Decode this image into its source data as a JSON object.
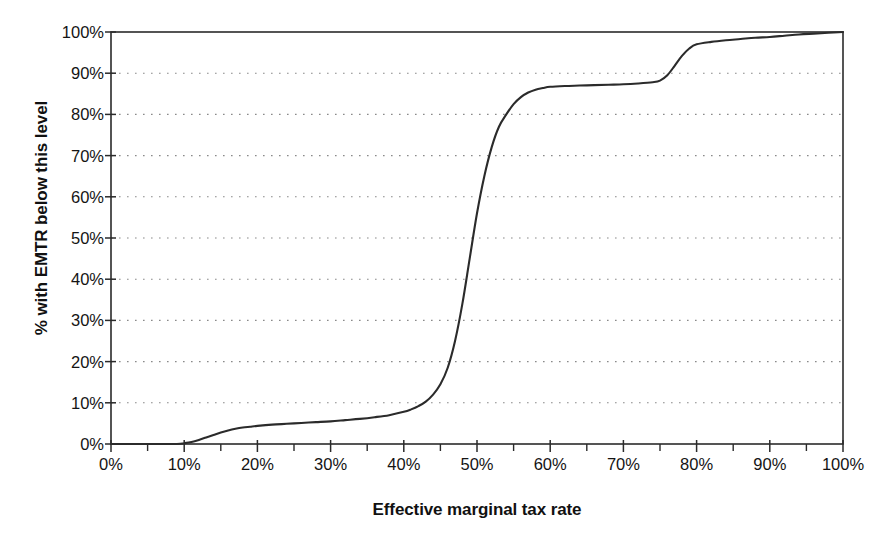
{
  "chart_data": {
    "type": "line",
    "title": "",
    "xlabel": "Effective marginal tax rate",
    "ylabel": "% with EMTR below this level",
    "xlim": [
      0,
      100
    ],
    "ylim": [
      0,
      100
    ],
    "grid": "horizontal-dotted",
    "legend": "none",
    "xticks": [
      "0%",
      "10%",
      "20%",
      "30%",
      "40%",
      "50%",
      "60%",
      "70%",
      "80%",
      "90%",
      "100%"
    ],
    "xtick_values": [
      0,
      10,
      20,
      30,
      40,
      50,
      60,
      70,
      80,
      90,
      100
    ],
    "yticks": [
      "0%",
      "10%",
      "20%",
      "30%",
      "40%",
      "50%",
      "60%",
      "70%",
      "80%",
      "90%",
      "100%"
    ],
    "ytick_values": [
      0,
      10,
      20,
      30,
      40,
      50,
      60,
      70,
      80,
      90,
      100
    ],
    "series": [
      {
        "name": "Cumulative distribution of EMTR",
        "color": "#2b2b2b",
        "x": [
          0,
          5,
          9,
          10,
          11,
          12,
          13,
          14,
          15,
          16,
          17,
          18,
          19,
          20,
          22,
          24,
          26,
          28,
          30,
          32,
          34,
          36,
          38,
          40,
          41,
          42,
          43,
          44,
          45,
          46,
          47,
          48,
          49,
          50,
          51,
          52,
          53,
          54,
          55,
          56,
          57,
          58,
          59,
          60,
          62,
          64,
          66,
          68,
          70,
          72,
          74,
          75,
          76,
          77,
          78,
          79,
          80,
          82,
          84,
          86,
          88,
          90,
          92,
          94,
          96,
          98,
          100
        ],
        "y": [
          0,
          0,
          0,
          0.2,
          0.5,
          1.0,
          1.6,
          2.2,
          2.8,
          3.3,
          3.7,
          4.0,
          4.2,
          4.4,
          4.7,
          4.9,
          5.1,
          5.3,
          5.5,
          5.8,
          6.1,
          6.5,
          7.0,
          7.8,
          8.4,
          9.2,
          10.3,
          12.0,
          14.5,
          18.5,
          25.0,
          34.0,
          45.0,
          56.0,
          65.0,
          72.0,
          77.0,
          80.0,
          82.5,
          84.2,
          85.3,
          86.0,
          86.4,
          86.7,
          86.9,
          87.0,
          87.1,
          87.2,
          87.3,
          87.5,
          87.8,
          88.2,
          89.5,
          91.8,
          94.2,
          96.0,
          97.0,
          97.6,
          98.0,
          98.3,
          98.6,
          98.8,
          99.1,
          99.4,
          99.6,
          99.8,
          100
        ]
      }
    ]
  },
  "axes": {
    "y_title": "% with EMTR below this level",
    "x_title": "Effective marginal tax rate"
  }
}
